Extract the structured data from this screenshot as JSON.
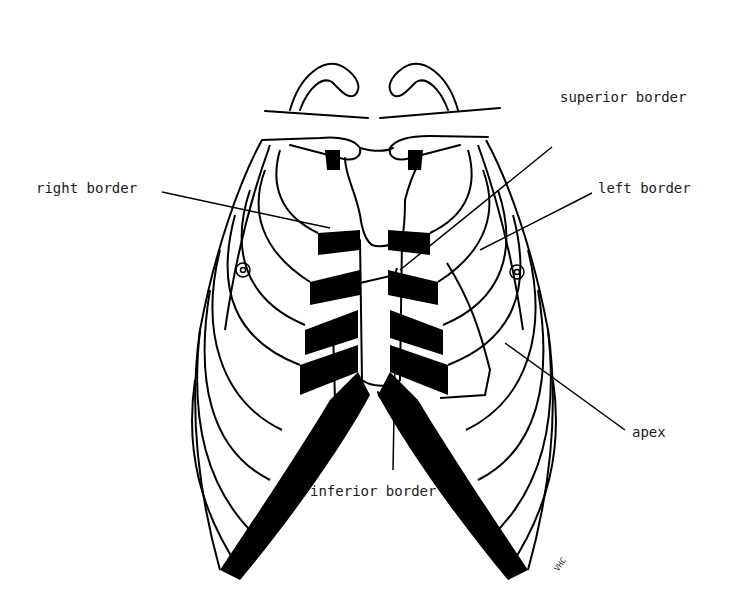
{
  "figure": {
    "labels": {
      "superior_border": "superior border",
      "right_border": "right border",
      "left_border": "left border",
      "apex": "apex",
      "inferior_border": "inferior border"
    },
    "signature": "VHC",
    "colors": {
      "ink": "#000000",
      "background": "#ffffff"
    }
  }
}
